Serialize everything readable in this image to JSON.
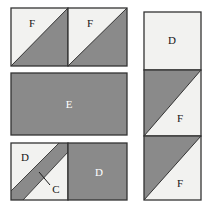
{
  "diagram": {
    "colors": {
      "dark_fill": "#8a8a8a",
      "light_fill": "#f2f2f0",
      "outline": "#333333",
      "background": "#ffffff",
      "label_light_text": "#ffffff",
      "label_dark_text": "#161616"
    },
    "left_group": {
      "top_row": {
        "pieces": [
          {
            "name": "top-left-square",
            "label": "F",
            "label_color": "dark",
            "diagonal": "tl-br",
            "light_part": "upper-left",
            "x": 11,
            "y": 8,
            "w": 57,
            "h": 58
          },
          {
            "name": "top-right-square",
            "label": "F",
            "label_color": "dark",
            "diagonal": "tl-br",
            "light_part": "upper-left",
            "x": 68,
            "y": 8,
            "w": 59,
            "h": 58
          }
        ]
      },
      "middle_row": {
        "pieces": [
          {
            "name": "center-rectangle",
            "label": "E",
            "label_color": "light",
            "fill": "dark",
            "x": 11,
            "y": 73,
            "w": 116,
            "h": 62
          }
        ]
      },
      "bottom_row": {
        "pieces": [
          {
            "name": "bottom-left-striped-square",
            "label": "D",
            "label_color": "dark",
            "stripe_label": "C",
            "stripe_label_color": "dark",
            "fill": "light",
            "x": 11,
            "y": 143,
            "w": 57,
            "h": 57
          },
          {
            "name": "bottom-right-square",
            "label": "D",
            "label_color": "light",
            "fill": "dark",
            "x": 68,
            "y": 143,
            "w": 59,
            "h": 57
          }
        ]
      }
    },
    "right_group": {
      "pieces": [
        {
          "name": "right-top-square",
          "label": "D",
          "label_color": "dark",
          "fill": "light",
          "x": 144,
          "y": 12,
          "w": 57,
          "h": 58
        },
        {
          "name": "right-middle-square",
          "label": "F",
          "label_color": "dark",
          "diagonal": "bl-tr",
          "light_part": "lower-right",
          "x": 144,
          "y": 70,
          "w": 57,
          "h": 66
        },
        {
          "name": "right-bottom-square",
          "label": "F",
          "label_color": "dark",
          "diagonal": "bl-tr",
          "light_part": "lower-right",
          "x": 144,
          "y": 136,
          "w": 57,
          "h": 64
        }
      ]
    },
    "labels": {
      "f_top_left": "F",
      "f_top_right": "F",
      "e_center": "E",
      "d_bottom_left": "D",
      "c_stripe": "C",
      "d_bottom_right": "D",
      "d_right_top": "D",
      "f_right_middle": "F",
      "f_right_bottom": "F"
    }
  }
}
